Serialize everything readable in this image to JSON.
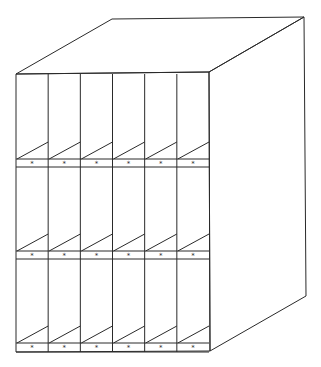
{
  "diagram": {
    "columns": 6,
    "rows": 3,
    "label_glyph": "*",
    "stroke_color": "#2a2a2a",
    "background": "#ffffff"
  }
}
